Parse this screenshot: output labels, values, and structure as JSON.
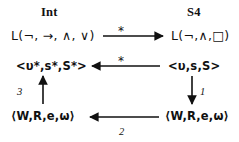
{
  "figure": {
    "type": "commutative-diagram",
    "background": "#ffffff",
    "ink_color": "#111111",
    "columns": [
      {
        "id": "int",
        "header": "Int"
      },
      {
        "id": "s4",
        "header": "S4"
      }
    ],
    "nodes": [
      {
        "id": "l-int",
        "column": "int",
        "row": 1,
        "label": "L(¬, →, ∧, ∨)"
      },
      {
        "id": "l-s4",
        "column": "s4",
        "row": 1,
        "label": "L(¬,∧,□)"
      },
      {
        "id": "t-star",
        "column": "int",
        "row": 2,
        "label": "<υ*,s*,S*>"
      },
      {
        "id": "t",
        "column": "s4",
        "row": 2,
        "label": "<υ,s,S>"
      },
      {
        "id": "k-int",
        "column": "int",
        "row": 3,
        "label": "⟨W,R,e,ω⟩"
      },
      {
        "id": "k-s4",
        "column": "s4",
        "row": 3,
        "label": "⟨W,R,e,ω⟩"
      }
    ],
    "arrows": [
      {
        "id": "a-top",
        "from": "l-int",
        "to": "l-s4",
        "direction": "right",
        "label": "*",
        "label_position": "above"
      },
      {
        "id": "a-middle",
        "from": "t",
        "to": "t-star",
        "direction": "left",
        "label": "*",
        "label_position": "above"
      },
      {
        "id": "a-bottom",
        "from": "k-s4",
        "to": "k-int",
        "direction": "left",
        "label": "2",
        "label_position": "below"
      },
      {
        "id": "a-right",
        "from": "t",
        "to": "k-s4",
        "direction": "down",
        "label": "1",
        "label_position": "right"
      },
      {
        "id": "a-left",
        "from": "k-int",
        "to": "t-star",
        "direction": "up",
        "label": "3",
        "label_position": "left"
      }
    ],
    "labels": {
      "header_int": "Int",
      "header_s4": "S4",
      "star_top": "*",
      "star_middle": "*",
      "num_right": "1",
      "num_bottom": "2",
      "num_left": "3"
    }
  }
}
